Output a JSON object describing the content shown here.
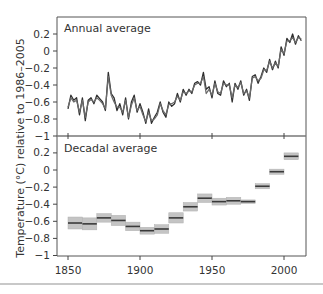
{
  "figure": {
    "ylabel": "Temperature (°C) relative to 1986–2005",
    "xticks": [
      "1850",
      "1900",
      "1950",
      "2000"
    ],
    "xtick_values": [
      1850,
      1900,
      1950,
      2000
    ],
    "colors": {
      "line": "#3a3a3a",
      "band": "#c4c4c4",
      "axis": "#444444"
    }
  },
  "panels": {
    "annual": {
      "title": "Annual average",
      "yticks": [
        "0.2",
        "0",
        "−0.2",
        "−0.4",
        "−0.6",
        "−0.8",
        "−1"
      ],
      "ytick_values": [
        0.2,
        0,
        -0.2,
        -0.4,
        -0.6,
        -0.8,
        -1
      ]
    },
    "decadal": {
      "title": "Decadal average",
      "yticks": [
        "0.2",
        "0",
        "−0.2",
        "−0.4",
        "−0.6",
        "−0.8",
        "−1"
      ],
      "ytick_values": [
        0.2,
        0,
        -0.2,
        -0.4,
        -0.6,
        -0.8,
        -1
      ]
    }
  },
  "chart_data": [
    {
      "type": "line",
      "title": "Annual average",
      "xlabel": "",
      "ylabel": "Temperature (°C) relative to 1986–2005",
      "xlim": [
        1843,
        2016
      ],
      "ylim": [
        -1,
        0.35
      ],
      "grid": false,
      "series": [
        {
          "name": "Dataset A",
          "x": [
            1850,
            1852,
            1854,
            1856,
            1858,
            1860,
            1862,
            1864,
            1866,
            1868,
            1870,
            1872,
            1874,
            1876,
            1878,
            1880,
            1882,
            1884,
            1886,
            1888,
            1890,
            1892,
            1894,
            1896,
            1898,
            1900,
            1902,
            1904,
            1906,
            1908,
            1910,
            1912,
            1914,
            1916,
            1918,
            1920,
            1922,
            1924,
            1926,
            1928,
            1930,
            1932,
            1934,
            1936,
            1938,
            1940,
            1942,
            1944,
            1946,
            1948,
            1950,
            1952,
            1954,
            1956,
            1958,
            1960,
            1962,
            1964,
            1966,
            1968,
            1970,
            1972,
            1974,
            1976,
            1978,
            1980,
            1982,
            1984,
            1986,
            1988,
            1990,
            1992,
            1994,
            1996,
            1998,
            2000,
            2002,
            2004,
            2006,
            2008,
            2010,
            2012
          ],
          "values": [
            -0.68,
            -0.52,
            -0.58,
            -0.55,
            -0.75,
            -0.55,
            -0.82,
            -0.58,
            -0.55,
            -0.62,
            -0.52,
            -0.56,
            -0.6,
            -0.7,
            -0.25,
            -0.5,
            -0.55,
            -0.7,
            -0.62,
            -0.75,
            -0.55,
            -0.8,
            -0.6,
            -0.52,
            -0.72,
            -0.62,
            -0.72,
            -0.85,
            -0.68,
            -0.85,
            -0.78,
            -0.72,
            -0.6,
            -0.72,
            -0.78,
            -0.6,
            -0.65,
            -0.62,
            -0.5,
            -0.6,
            -0.45,
            -0.52,
            -0.45,
            -0.5,
            -0.38,
            -0.36,
            -0.4,
            -0.25,
            -0.45,
            -0.42,
            -0.55,
            -0.35,
            -0.5,
            -0.52,
            -0.35,
            -0.42,
            -0.38,
            -0.6,
            -0.38,
            -0.45,
            -0.35,
            -0.52,
            -0.45,
            -0.58,
            -0.3,
            -0.28,
            -0.38,
            -0.3,
            -0.2,
            -0.25,
            -0.1,
            -0.22,
            -0.12,
            -0.2,
            0.05,
            -0.05,
            0.15,
            0.1,
            0.2,
            0.08,
            0.18,
            0.12
          ]
        },
        {
          "name": "Dataset B",
          "x": [
            1850,
            1852,
            1854,
            1856,
            1858,
            1860,
            1862,
            1864,
            1866,
            1868,
            1870,
            1872,
            1874,
            1876,
            1878,
            1880,
            1882,
            1884,
            1886,
            1888,
            1890,
            1892,
            1894,
            1896,
            1898,
            1900,
            1902,
            1904,
            1906,
            1908,
            1910,
            1912,
            1914,
            1916,
            1918,
            1920,
            1922,
            1924,
            1926,
            1928,
            1930,
            1932,
            1934,
            1936,
            1938,
            1940,
            1942,
            1944,
            1946,
            1948,
            1950,
            1952,
            1954,
            1956,
            1958,
            1960,
            1962,
            1964,
            1966,
            1968,
            1970,
            1972,
            1974,
            1976,
            1978,
            1980,
            1982,
            1984,
            1986,
            1988,
            1990,
            1992,
            1994,
            1996,
            1998,
            2000,
            2002,
            2004,
            2006,
            2008,
            2010,
            2012
          ],
          "values": [
            -0.66,
            -0.55,
            -0.6,
            -0.58,
            -0.72,
            -0.58,
            -0.78,
            -0.6,
            -0.57,
            -0.6,
            -0.55,
            -0.58,
            -0.62,
            -0.68,
            -0.3,
            -0.52,
            -0.6,
            -0.66,
            -0.66,
            -0.72,
            -0.58,
            -0.78,
            -0.64,
            -0.55,
            -0.7,
            -0.65,
            -0.75,
            -0.83,
            -0.72,
            -0.82,
            -0.8,
            -0.75,
            -0.62,
            -0.7,
            -0.75,
            -0.63,
            -0.62,
            -0.6,
            -0.53,
            -0.58,
            -0.48,
            -0.5,
            -0.47,
            -0.48,
            -0.4,
            -0.38,
            -0.38,
            -0.3,
            -0.5,
            -0.45,
            -0.52,
            -0.38,
            -0.48,
            -0.5,
            -0.38,
            -0.4,
            -0.4,
            -0.55,
            -0.4,
            -0.43,
            -0.37,
            -0.5,
            -0.47,
            -0.55,
            -0.32,
            -0.3,
            -0.35,
            -0.32,
            -0.22,
            -0.23,
            -0.12,
            -0.2,
            -0.14,
            -0.18,
            0.02,
            -0.03,
            0.12,
            0.12,
            0.16,
            0.1,
            0.16,
            0.14
          ]
        }
      ],
      "yticks": [
        0.2,
        0,
        -0.2,
        -0.4,
        -0.6,
        -0.8,
        -1
      ]
    },
    {
      "type": "bar",
      "title": "Decadal average",
      "xlabel": "",
      "ylabel": "Temperature (°C) relative to 1986–2005",
      "xlim": [
        1843,
        2016
      ],
      "ylim": [
        -1,
        0.35
      ],
      "grid": false,
      "categories": [
        "1850s",
        "1860s",
        "1870s",
        "1880s",
        "1890s",
        "1900s",
        "1910s",
        "1920s",
        "1930s",
        "1940s",
        "1950s",
        "1960s",
        "1970s",
        "1980s",
        "1990s",
        "2000s"
      ],
      "decade_start": [
        1850,
        1860,
        1870,
        1880,
        1890,
        1900,
        1910,
        1920,
        1930,
        1940,
        1950,
        1960,
        1970,
        1980,
        1990,
        2000
      ],
      "values": [
        -0.62,
        -0.63,
        -0.56,
        -0.59,
        -0.66,
        -0.71,
        -0.69,
        -0.56,
        -0.43,
        -0.33,
        -0.37,
        -0.36,
        -0.37,
        -0.19,
        -0.02,
        0.16
      ],
      "uncertainty": [
        0.07,
        0.07,
        0.05,
        0.06,
        0.05,
        0.04,
        0.05,
        0.06,
        0.05,
        0.05,
        0.04,
        0.04,
        0.02,
        0.03,
        0.03,
        0.04
      ],
      "yticks": [
        0.2,
        0,
        -0.2,
        -0.4,
        -0.6,
        -0.8,
        -1
      ],
      "xticks": [
        1850,
        1900,
        1950,
        2000
      ]
    }
  ]
}
